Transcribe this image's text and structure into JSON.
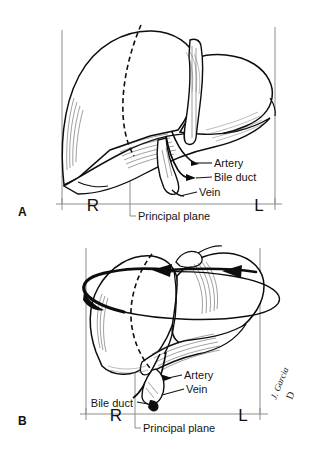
{
  "figure": {
    "background_color": "#ffffff",
    "ink_color": "#0d0d0d",
    "guide_color": "#8d8d8d",
    "panels": [
      {
        "letter": "A",
        "view_name": "anterior-view",
        "side_markers": {
          "right": "R",
          "left": "L"
        },
        "baseline_caption": "Principal plane",
        "callouts": [
          {
            "label": "Artery",
            "name": "artery"
          },
          {
            "label": "Bile duct",
            "name": "bile-duct"
          },
          {
            "label": "Vein",
            "name": "vein"
          }
        ]
      },
      {
        "letter": "B",
        "view_name": "rotated-view",
        "side_markers": {
          "right": "R",
          "left": "L"
        },
        "baseline_caption": "Principal plane",
        "callouts": [
          {
            "label": "Artery",
            "name": "artery"
          },
          {
            "label": "Vein",
            "name": "vein"
          },
          {
            "label": "Bile duct",
            "name": "bile-duct"
          }
        ],
        "rotation_arrow": {
          "name": "rotation-arrow",
          "description": "elliptical arrow encircling the liver indicating axial rotation",
          "arrowhead_count": 2,
          "direction": "leftward"
        }
      }
    ],
    "signature": {
      "artist": "J. Garcia",
      "mark": "D"
    }
  }
}
